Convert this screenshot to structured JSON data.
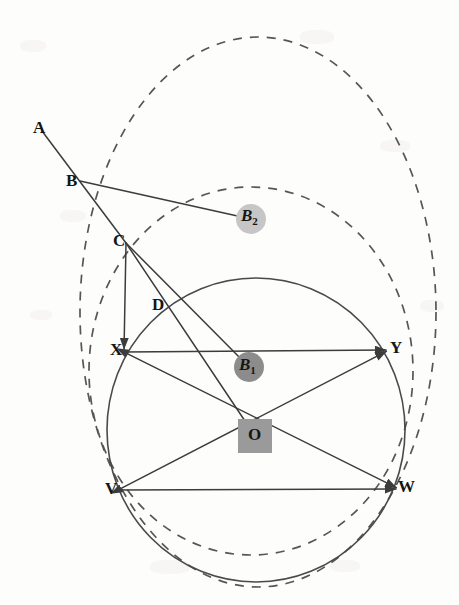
{
  "figure": {
    "background_color": "#fdfdfc",
    "stroke_color": "#3c3c3c",
    "label_color": "#151515"
  },
  "points": [
    {
      "id": "A",
      "label": "A",
      "x": 42,
      "y": 131,
      "label_x": 33,
      "label_y": 119,
      "marker": "none"
    },
    {
      "id": "B",
      "label": "B",
      "x": 80,
      "y": 181,
      "label_x": 66,
      "label_y": 172,
      "marker": "none"
    },
    {
      "id": "C",
      "label": "C",
      "x": 126,
      "y": 243,
      "label_x": 113,
      "label_y": 232,
      "marker": "none"
    },
    {
      "id": "D",
      "label": "D",
      "x": 167,
      "y": 305,
      "label_x": 152,
      "label_y": 296,
      "marker": "none"
    },
    {
      "id": "X",
      "label": "X",
      "x": 124,
      "y": 352,
      "label_x": 110,
      "label_y": 341,
      "marker": "none"
    },
    {
      "id": "Y",
      "label": "Y",
      "x": 389,
      "y": 350,
      "label_x": 390,
      "label_y": 339,
      "marker": "none"
    },
    {
      "id": "V",
      "label": "V",
      "x": 118,
      "y": 490,
      "label_x": 105,
      "label_y": 480,
      "marker": "none"
    },
    {
      "id": "W",
      "label": "W",
      "x": 399,
      "y": 489,
      "label_x": 398,
      "label_y": 478,
      "marker": "none"
    },
    {
      "id": "O",
      "label": "O",
      "x": 255,
      "y": 436,
      "label_x": 248,
      "label_y": 426,
      "marker": "square"
    },
    {
      "id": "B1",
      "label": "B",
      "sub": "1",
      "x": 249,
      "y": 367,
      "label_x": 239,
      "label_y": 356,
      "marker": "dot-dark"
    },
    {
      "id": "B2",
      "label": "B",
      "sub": "2",
      "x": 251,
      "y": 219,
      "label_x": 241,
      "label_y": 207,
      "marker": "dot-light"
    }
  ],
  "markers": {
    "square": {
      "size": 34,
      "color": "#9a9a9a",
      "name": "center-highlight-square"
    },
    "dot_dark": {
      "radius": 15,
      "color": "#8c8c8c",
      "name": "b1-dot"
    },
    "dot_light": {
      "radius": 15,
      "color": "#c6c6c6",
      "name": "b2-dot"
    }
  },
  "circles": [
    {
      "id": "outer-dashed",
      "style": "dashed",
      "cx": 258,
      "cy": 312,
      "rx": 178,
      "ry": 275,
      "rotate": 0,
      "stroke": "#565656",
      "stroke_width": 1.7,
      "dash": "9 8"
    },
    {
      "id": "inner-dashed",
      "style": "dashed",
      "cx": 251,
      "cy": 371,
      "rx": 162,
      "ry": 184,
      "rotate": 0,
      "stroke": "#565656",
      "stroke_width": 1.7,
      "dash": "9 8"
    },
    {
      "id": "solid-main",
      "style": "solid",
      "cx": 256,
      "cy": 430,
      "rx": 149,
      "ry": 152,
      "rotate": 0,
      "stroke": "#4a4a4a",
      "stroke_width": 1.6,
      "dash": "none"
    }
  ],
  "segments": [
    {
      "id": "A-B-C",
      "from": "A",
      "to": "C",
      "via": "B",
      "arrow": "none",
      "name": "line-a-to-c"
    },
    {
      "id": "B-B2",
      "from": "B",
      "to": "B2",
      "arrow": "none",
      "name": "line-b-to-b2"
    },
    {
      "id": "C-B1",
      "from": "C",
      "to": "B1",
      "arrow": "none",
      "name": "line-c-to-b1"
    },
    {
      "id": "C-O",
      "from": "C",
      "to": "O",
      "arrow": "none",
      "name": "line-c-to-o"
    },
    {
      "id": "C-X",
      "from": "C",
      "to": "X",
      "arrow": "end",
      "name": "line-c-to-x"
    },
    {
      "id": "X-W",
      "from": "X",
      "to": "W",
      "arrow": "both",
      "name": "chord-x-to-w"
    },
    {
      "id": "V-Y",
      "from": "V",
      "to": "Y",
      "arrow": "both",
      "name": "chord-v-to-y"
    },
    {
      "id": "X-Y",
      "from": "X",
      "to": "Y",
      "arrow": "end",
      "name": "chord-x-to-y"
    },
    {
      "id": "V-W",
      "from": "V",
      "to": "W",
      "arrow": "end",
      "name": "chord-v-to-w"
    }
  ],
  "legend": {
    "note": ""
  }
}
